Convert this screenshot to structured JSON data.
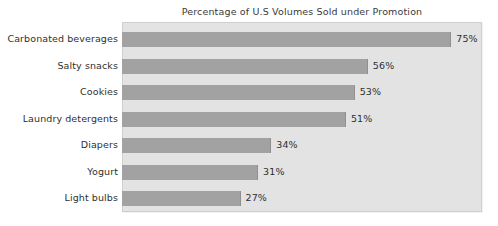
{
  "chart_data": {
    "type": "bar",
    "orientation": "horizontal",
    "title": "Percentage of U.S Volumes Sold under Promotion",
    "xlabel": "",
    "ylabel": "",
    "xlim": [
      0,
      82
    ],
    "grid": false,
    "legend": null,
    "value_suffix": "%",
    "categories": [
      "Carbonated beverages",
      "Salty snacks",
      "Cookies",
      "Laundry detergents",
      "Diapers",
      "Yogurt",
      "Light bulbs"
    ],
    "values": [
      75,
      56,
      53,
      51,
      34,
      31,
      27
    ],
    "data_labels": [
      "75%",
      "56%",
      "53%",
      "51%",
      "34%",
      "31%",
      "27%"
    ],
    "colors": {
      "bar_fill": "#a2a2a2",
      "plot_background": "#e3e3e3",
      "page_background": "#ffffff",
      "text": "#2f2f2f",
      "title_text": "#3a3a3a",
      "plot_border": "#cfcfcf"
    }
  }
}
